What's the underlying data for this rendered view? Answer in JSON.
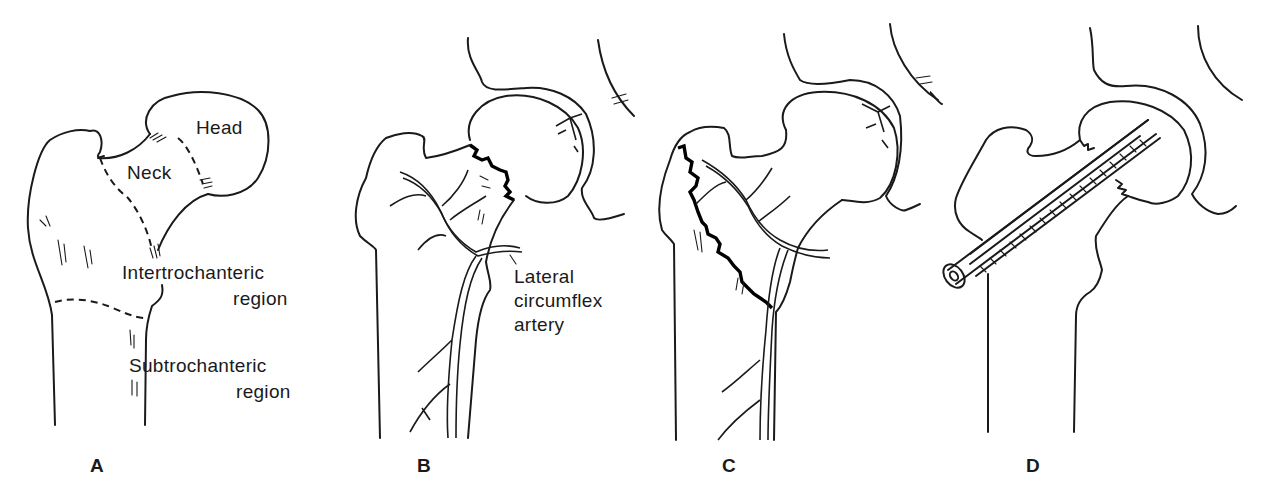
{
  "figure": {
    "panels": [
      {
        "id": "A",
        "label": "A",
        "annotations": {
          "head": "Head",
          "neck": "Neck",
          "intertrochanteric_line1": "Intertrochanteric",
          "intertrochanteric_line2": "region",
          "subtrochanteric_line1": "Subtrochanteric",
          "subtrochanteric_line2": "region"
        }
      },
      {
        "id": "B",
        "label": "B",
        "annotations": {
          "artery_line1": "Lateral",
          "artery_line2": "circumflex",
          "artery_line3": "artery"
        }
      },
      {
        "id": "C",
        "label": "C"
      },
      {
        "id": "D",
        "label": "D"
      }
    ],
    "colors": {
      "ink": "#1a1a1a",
      "background": "#ffffff"
    }
  }
}
